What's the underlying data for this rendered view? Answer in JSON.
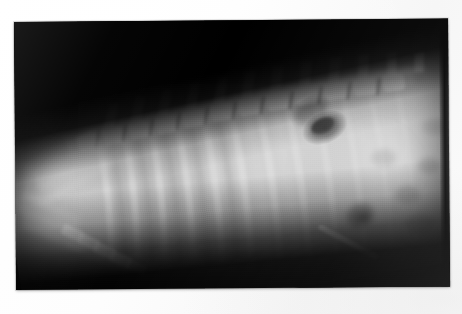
{
  "image": {
    "kind": "radiograph-photo",
    "modality": "X-ray",
    "view": "lateral",
    "subject": "small animal thorax and cranial abdomen",
    "caption": "Lateral thoracic radiograph showing a bright linear metallic foreign body",
    "canvas": {
      "width": 462,
      "height": 314
    },
    "background_color": "#ffffff",
    "film_color": "#050505",
    "border": {
      "style": "white photographic print margin",
      "color": "#ffffff"
    },
    "print": {
      "left": 14,
      "top": 22,
      "width": 434,
      "height": 268,
      "rotation_deg": -0.45
    }
  },
  "features": [
    {
      "name": "collimation-air",
      "label": "Dark non-exposed background (air / collimation)",
      "region": "upper-left and lower band",
      "tone": "#000000"
    },
    {
      "name": "thoracic-vertebrae",
      "label": "Thoracic vertebral column with dorsal spinous processes",
      "region": "upper centre, running diagonally",
      "tone": "#e8e8e8"
    },
    {
      "name": "rib-cage",
      "label": "Ribs seen as oblique parallel radiopaque bands",
      "region": "centre",
      "tone": "#d8d8d8"
    },
    {
      "name": "scapula",
      "label": "Scapula overlying the cranial thorax",
      "region": "left",
      "tone": "#cfcfcf"
    },
    {
      "name": "sternum",
      "label": "Sternebrae along the ventral thoracic margin",
      "region": "lower left",
      "tone": "#dcdcdc"
    },
    {
      "name": "gas-lucency",
      "label": "Focal dark gas lucency (gas-filled viscus)",
      "region": "upper right of thorax",
      "tone": "#101010"
    },
    {
      "name": "abdominal-soft-tissue",
      "label": "Cranial abdominal soft-tissue opacity with gas pockets",
      "region": "right",
      "tone": "#cdcdcd"
    },
    {
      "name": "metallic-foreign-body",
      "label": "Bright linear metallic foreign body (needle)",
      "region": "lower right of thorax",
      "tone": "#ffffff"
    },
    {
      "name": "overexposed-lung",
      "label": "Bright overexposed lung field",
      "region": "centre",
      "tone": "#f2f2f2"
    }
  ],
  "foreign_body": {
    "shape": "straight radiodense linear rod",
    "start": {
      "x": 320,
      "y": 230
    },
    "end": {
      "x": 373,
      "y": 259
    },
    "length_px": 60,
    "angle_deg": 28,
    "color": "#ffffff"
  },
  "annotations": {
    "text_present": false,
    "markers": []
  }
}
